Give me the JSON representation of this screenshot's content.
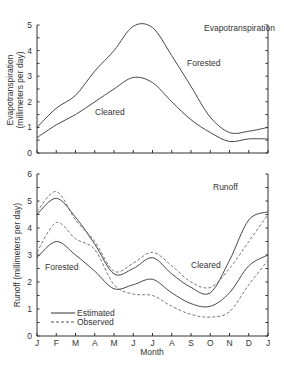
{
  "chart_data": [
    {
      "type": "line",
      "title": "Evapotranspiration",
      "xlabel": "",
      "ylabel": "Evapotranspiration (millimeters per day)",
      "ylabel_line1": "Evapotranspiration",
      "ylabel_line2": "(millimeters per day)",
      "ylim": [
        0,
        5
      ],
      "yticks": [
        0,
        1,
        2,
        3,
        4,
        5
      ],
      "categories": [
        "J",
        "F",
        "M",
        "A",
        "M",
        "J",
        "J",
        "A",
        "S",
        "O",
        "N",
        "D",
        "J"
      ],
      "grid": false,
      "series": [
        {
          "name": "Forested",
          "style": "solid",
          "values": [
            1.0,
            1.75,
            2.25,
            3.2,
            4.0,
            4.95,
            4.9,
            3.8,
            2.6,
            1.4,
            0.8,
            0.85,
            1.0
          ]
        },
        {
          "name": "Cleared",
          "style": "solid",
          "values": [
            0.6,
            1.1,
            1.5,
            2.0,
            2.5,
            2.95,
            2.75,
            2.0,
            1.3,
            0.8,
            0.45,
            0.55,
            0.55
          ]
        }
      ],
      "annotations": [
        "Evapotranspiration",
        "Forested",
        "Cleared"
      ]
    },
    {
      "type": "line",
      "title": "Runoff",
      "xlabel": "Month",
      "ylabel": "Runoff (millimeters per day)",
      "ylim": [
        0,
        6
      ],
      "yticks": [
        0,
        1,
        2,
        3,
        4,
        5,
        6
      ],
      "categories": [
        "J",
        "F",
        "M",
        "A",
        "M",
        "J",
        "J",
        "A",
        "S",
        "O",
        "N",
        "D",
        "J"
      ],
      "grid": false,
      "legend": {
        "position": "lower-left",
        "entries": [
          "Estimated",
          "Observed"
        ]
      },
      "series": [
        {
          "name": "Cleared - Estimated",
          "style": "solid",
          "values": [
            4.5,
            5.1,
            4.4,
            3.4,
            2.3,
            2.5,
            2.9,
            2.3,
            1.8,
            1.6,
            2.8,
            4.3,
            4.6
          ]
        },
        {
          "name": "Cleared - Observed",
          "style": "dashed",
          "values": [
            4.6,
            5.35,
            4.3,
            3.5,
            2.4,
            2.7,
            3.1,
            2.6,
            2.0,
            1.8,
            2.5,
            3.5,
            4.5
          ]
        },
        {
          "name": "Forested - Estimated",
          "style": "solid",
          "values": [
            2.9,
            3.5,
            3.0,
            2.4,
            1.75,
            1.9,
            2.1,
            1.6,
            1.2,
            1.1,
            1.6,
            2.6,
            3.0
          ]
        },
        {
          "name": "Forested - Observed",
          "style": "dashed",
          "values": [
            3.1,
            4.2,
            3.6,
            3.2,
            1.9,
            1.55,
            1.5,
            1.1,
            0.8,
            0.7,
            0.9,
            1.9,
            2.8
          ]
        }
      ],
      "annotations": [
        "Runoff",
        "Cleared",
        "Forested"
      ]
    }
  ],
  "labels": {
    "top_title": "Evapotranspiration",
    "top_forested": "Forested",
    "top_cleared": "Cleared",
    "top_ylabel_1": "Evapotranspiration",
    "top_ylabel_2": "(millimeters per day)",
    "bottom_title": "Runoff",
    "bottom_cleared": "Cleared",
    "bottom_forested": "Forested",
    "bottom_ylabel": "Runoff (millimeters per day)",
    "xlabel": "Month",
    "legend_estimated": "Estimated",
    "legend_observed": "Observed"
  }
}
